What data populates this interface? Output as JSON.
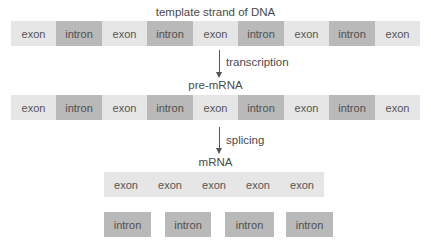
{
  "diagram": {
    "dna": {
      "title": "template strand of DNA",
      "segments": [
        {
          "type": "exon",
          "label": "exon"
        },
        {
          "type": "intron",
          "label": "intron"
        },
        {
          "type": "exon",
          "label": "exon"
        },
        {
          "type": "intron",
          "label": "intron"
        },
        {
          "type": "exon",
          "label": "exon"
        },
        {
          "type": "intron",
          "label": "intron"
        },
        {
          "type": "exon",
          "label": "exon"
        },
        {
          "type": "intron",
          "label": "intron"
        },
        {
          "type": "exon",
          "label": "exon"
        }
      ]
    },
    "step1": {
      "label": "transcription"
    },
    "pre_mrna": {
      "title": "pre-mRNA",
      "segments": [
        {
          "type": "exon",
          "label": "exon"
        },
        {
          "type": "intron",
          "label": "intron"
        },
        {
          "type": "exon",
          "label": "exon"
        },
        {
          "type": "intron",
          "label": "intron"
        },
        {
          "type": "exon",
          "label": "exon"
        },
        {
          "type": "intron",
          "label": "intron"
        },
        {
          "type": "exon",
          "label": "exon"
        },
        {
          "type": "intron",
          "label": "intron"
        },
        {
          "type": "exon",
          "label": "exon"
        }
      ]
    },
    "step2": {
      "label": "splicing"
    },
    "mrna": {
      "title": "mRNA",
      "segments": [
        {
          "type": "exon",
          "label": "exon"
        },
        {
          "type": "exon",
          "label": "exon"
        },
        {
          "type": "exon",
          "label": "exon"
        },
        {
          "type": "exon",
          "label": "exon"
        },
        {
          "type": "exon",
          "label": "exon"
        }
      ]
    },
    "removed_introns": [
      {
        "label": "intron"
      },
      {
        "label": "intron"
      },
      {
        "label": "intron"
      },
      {
        "label": "intron"
      }
    ],
    "colors": {
      "exon": "#e6e6e6",
      "intron": "#b9b9b9",
      "text": "#555555",
      "arrow": "#555555"
    }
  }
}
